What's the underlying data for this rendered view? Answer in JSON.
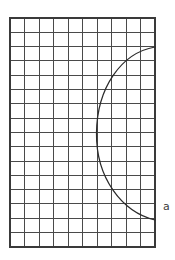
{
  "figure": {
    "background_color": "#ffffff",
    "canvas": {
      "width": 175,
      "height": 260
    }
  },
  "grid": {
    "name": "graph-paper-grid",
    "origin_x": 10,
    "origin_y": 18,
    "columns": 10,
    "rows": 16,
    "cell_width": 14.5,
    "cell_height": 14.3,
    "width": 145,
    "height": 229,
    "right_edge_x": 155,
    "bottom_edge_y": 247,
    "line_color": "#4a4a4a",
    "border_color": "#3a3a3a",
    "line_width": 1
  },
  "curve": {
    "name": "arc-a",
    "label": "a",
    "type": "circular-arc",
    "color": "#2b2b2b",
    "stroke_width": 1.25,
    "start_point": {
      "x": 155,
      "y": 47
    },
    "end_point": {
      "x": 155,
      "y": 220
    },
    "leftmost_point": {
      "x": 96,
      "y": 133
    },
    "bulge_direction": "left",
    "path": "M 155 47 C 121 53, 97 88, 96.5 133 C 96 178, 122 212, 155 220"
  },
  "label": {
    "name": "curve-label-a",
    "text": "a",
    "x": 163,
    "y": 207,
    "color": "#3c3c3c",
    "font_size": 11
  },
  "chart_data": {
    "type": "line",
    "title": "",
    "xlabel": "",
    "ylabel": "",
    "grid": true,
    "legend_position": "none",
    "xlim": [
      0,
      10
    ],
    "ylim": [
      0,
      16
    ],
    "annotations": [
      {
        "text": "a",
        "x": 10.6,
        "y": 2.8
      }
    ],
    "series": [
      {
        "name": "a",
        "comment": "Arc in grid-cell units; x counted from left grid edge, y counted upward from bottom grid edge.",
        "x": [
          10.0,
          9.0,
          8.0,
          7.2,
          6.6,
          6.2,
          6.0,
          5.95,
          6.0,
          6.2,
          6.6,
          7.2,
          8.0,
          9.0,
          10.0
        ],
        "y": [
          14.0,
          13.55,
          12.9,
          12.2,
          11.3,
          10.3,
          9.2,
          8.0,
          6.8,
          5.7,
          4.7,
          3.8,
          3.1,
          2.45,
          1.9
        ]
      }
    ]
  }
}
